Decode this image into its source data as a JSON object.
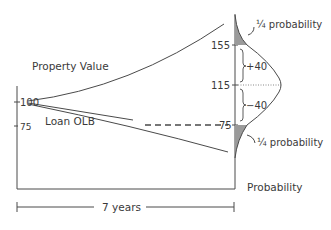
{
  "diagram": {
    "labels": {
      "property_value": "Property Value",
      "loan_olb": "Loan OLB",
      "probability_axis": "Probability",
      "time_span": "7 years"
    },
    "left_axis": {
      "ticks": [
        {
          "value": "100"
        },
        {
          "value": "75"
        }
      ]
    },
    "right_axis": {
      "ticks": [
        {
          "value": "155"
        },
        {
          "value": "115"
        },
        {
          "value": "75"
        }
      ]
    },
    "intervals": {
      "upper": "+40",
      "lower": "−40"
    },
    "tail_annotations": {
      "upper": "¼ probability",
      "lower": "¼ probability"
    },
    "colors": {
      "line": "#4a4a4a",
      "tail_fill": "#9a9a9a"
    }
  }
}
